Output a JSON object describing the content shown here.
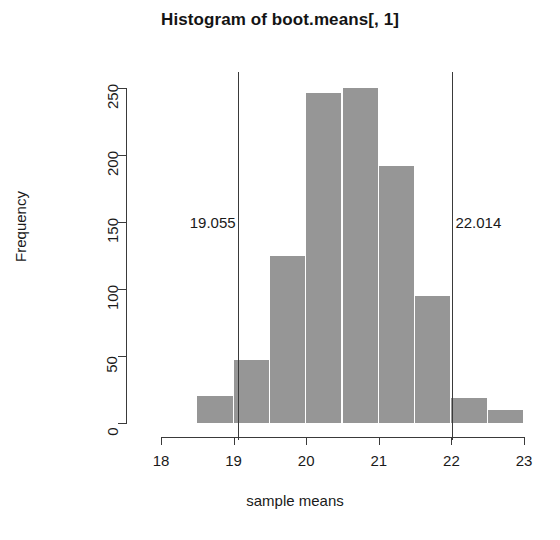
{
  "chart_data": {
    "type": "bar",
    "title": "Histogram of boot.means[, 1]",
    "xlabel": "sample means",
    "ylabel": "Frequency",
    "xlim": [
      18,
      23
    ],
    "ylim": [
      0,
      250
    ],
    "grid": false,
    "legend": null,
    "bin_width": 0.5,
    "bin_edges": [
      18.5,
      19.0,
      19.5,
      20.0,
      20.5,
      21.0,
      21.5,
      22.0,
      22.5,
      23.0
    ],
    "categories": [
      "18.5-19.0",
      "19.0-19.5",
      "19.5-20.0",
      "20.0-20.5",
      "20.5-21.0",
      "21.0-21.5",
      "21.5-22.0",
      "22.0-22.5",
      "22.5-23.0"
    ],
    "values": [
      20,
      47,
      125,
      246,
      250,
      192,
      95,
      19,
      10
    ],
    "bar_color": "#969696",
    "xticks": [
      18,
      19,
      20,
      21,
      22,
      23
    ],
    "xtick_labels": [
      "18",
      "19",
      "20",
      "21",
      "22",
      "23"
    ],
    "yticks": [
      0,
      50,
      100,
      150,
      200,
      250
    ],
    "ytick_labels": [
      "0",
      "50",
      "100",
      "150",
      "200",
      "250"
    ],
    "annotations": [
      {
        "name": "lower-ci-line",
        "value": 19.055,
        "label": "19.055",
        "label_side": "left",
        "color": "#3a3a3a"
      },
      {
        "name": "upper-ci-line",
        "value": 22.014,
        "label": "22.014",
        "label_side": "right",
        "color": "#3a3a3a"
      }
    ],
    "annotation_label_y": 215
  }
}
